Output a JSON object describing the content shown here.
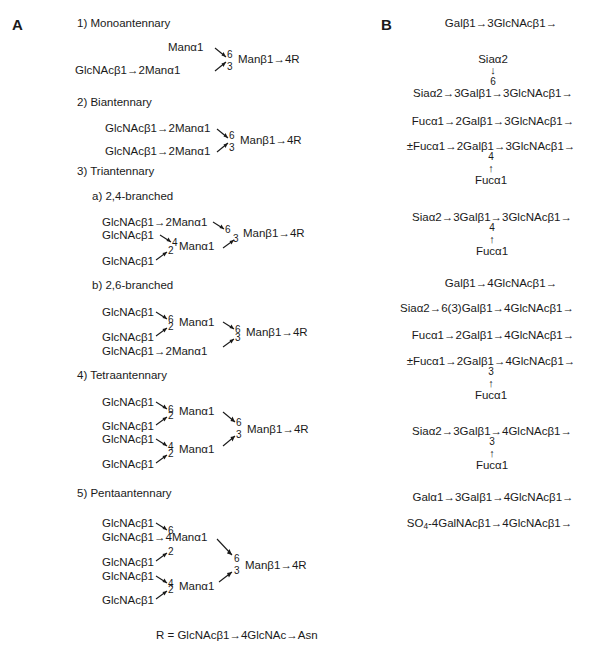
{
  "figure": {
    "panel_a_letter": "A",
    "panel_b_letter": "B",
    "r_definition": "R = GlcNAcβ1→4GlcNAc→Asn"
  },
  "panel_a": {
    "sections": [
      {
        "label": "1) Monoantennary"
      },
      {
        "label": "2) Biantennary"
      },
      {
        "label": "3) Triantennary"
      },
      {
        "label": "a) 2,4-branched"
      },
      {
        "label": "b) 2,6-branched"
      },
      {
        "label": "4) Tetraantennary"
      },
      {
        "label": "5) Pentaantennary"
      }
    ],
    "mono": {
      "upper_arm": "Manα1",
      "lower_arm": "GlcNAcβ1→2Manα1",
      "core": "Manβ1→4R",
      "pos_upper": "6",
      "pos_lower": "3"
    },
    "bi": {
      "upper_arm": "GlcNAcβ1→2Manα1",
      "lower_arm": "GlcNAcβ1→2Manα1",
      "core": "Manβ1→4R",
      "pos_upper": "6",
      "pos_lower": "3"
    },
    "tri_24": {
      "arm1": "GlcNAcβ1→2Manα1",
      "arm2": "GlcNAcβ1",
      "arm3": "GlcNAcβ1",
      "man_lower": "Manα1",
      "core": "Manβ1→4R",
      "pos_arm1": "6",
      "pos_arm2": "4",
      "pos_arm3": "2",
      "pos_core": "3"
    },
    "tri_26": {
      "arm1": "GlcNAcβ1",
      "arm2": "GlcNAcβ1",
      "arm3": "GlcNAcβ1→2Manα1",
      "man_upper": "Manα1",
      "core": "Manβ1→4R",
      "pos_arm1": "6",
      "pos_arm2": "2",
      "pos_upper": "6",
      "pos_arm3": "3"
    },
    "tetra": {
      "arm1": "GlcNAcβ1",
      "arm2": "GlcNAcβ1",
      "arm3": "GlcNAcβ1",
      "arm4": "GlcNAcβ1",
      "man_upper": "Manα1",
      "man_lower": "Manα1",
      "core": "Manβ1→4R",
      "pos_arm1": "6",
      "pos_arm2": "2",
      "pos_arm3": "4",
      "pos_arm4": "2",
      "pos_upper": "6",
      "pos_lower": "3"
    },
    "penta": {
      "arm1": "GlcNAcβ1",
      "arm2": "GlcNAcβ1→4Manα1",
      "arm3": "GlcNAcβ1",
      "arm4": "GlcNAcβ1",
      "arm5": "GlcNAcβ1",
      "man_lower": "Manα1",
      "core": "Manβ1→4R",
      "pos_arm1": "6",
      "pos_arm3": "2",
      "pos_arm4": "4",
      "pos_arm5": "2",
      "pos_upper": "6",
      "pos_lower": "3"
    }
  },
  "panel_b": {
    "entries": [
      {
        "main": "Galβ1→3GlcNAcβ1→"
      },
      {
        "top": "Siaα2",
        "arrow": "↓",
        "pos": "6",
        "main": "Siaα2→3Galβ1→3GlcNAcβ1→"
      },
      {
        "main": "Fucα1→2Galβ1→3GlcNAcβ1→"
      },
      {
        "main": "±Fucα1→2Galβ1→3GlcNAcβ1→",
        "pos": "4",
        "arrow": "↑",
        "bottom": "Fucα1"
      },
      {
        "main": "Siaα2→3Galβ1→3GlcNAcβ1→",
        "pos": "4",
        "arrow": "↑",
        "bottom": "Fucα1"
      },
      {
        "main": "Galβ1→4GlcNAcβ1→"
      },
      {
        "main": "Siaα2→6(3)Galβ1→4GlcNAcβ1→"
      },
      {
        "main": "Fucα1→2Galβ1→4GlcNAcβ1→"
      },
      {
        "main": "±Fucα1→2Galβ1→4GlcNAcβ1→",
        "pos": "3",
        "arrow": "↑",
        "bottom": "Fucα1"
      },
      {
        "main": "Siaα2→3Galβ1→4GlcNAcβ1→",
        "pos": "3",
        "arrow": "↑",
        "bottom": "Fucα1"
      },
      {
        "main": "Galα1→3Galβ1→4GlcNAcβ1→"
      },
      {
        "main_pre": "SO",
        "main_sub": "4",
        "main_post": "-4GalNAcβ1→4GlcNAcβ1→"
      }
    ]
  }
}
